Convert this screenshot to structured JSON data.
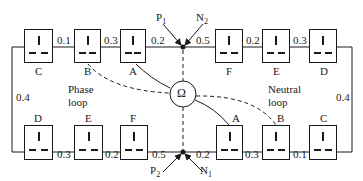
{
  "diagram": {
    "meter": {
      "symbol": "Ω"
    },
    "top_row": {
      "sockets": [
        {
          "label": "C"
        },
        {
          "label": "B"
        },
        {
          "label": "A"
        },
        {
          "label": "F"
        },
        {
          "label": "E"
        },
        {
          "label": "D"
        }
      ],
      "resistances": [
        "0.1",
        "0.3",
        "0.2",
        "0.5",
        "0.2",
        "0.3"
      ]
    },
    "bottom_row": {
      "sockets": [
        {
          "label": "D"
        },
        {
          "label": "E"
        },
        {
          "label": "F"
        },
        {
          "label": "A"
        },
        {
          "label": "B"
        },
        {
          "label": "C"
        }
      ],
      "resistances": [
        "0.3",
        "0.2",
        "0.5",
        "0.2",
        "0.3",
        "0.1"
      ]
    },
    "side_resistances": {
      "left": "0.4",
      "right": "0.4"
    },
    "terminals": {
      "top_left": {
        "letter": "P",
        "sub": "1"
      },
      "top_right": {
        "letter": "N",
        "sub": "2"
      },
      "bottom_left": {
        "letter": "P",
        "sub": "2"
      },
      "bottom_right": {
        "letter": "N",
        "sub": "1"
      }
    },
    "loop_labels": {
      "phase": [
        "Phase",
        "loop"
      ],
      "neutral": [
        "Neutral",
        "loop"
      ]
    }
  }
}
